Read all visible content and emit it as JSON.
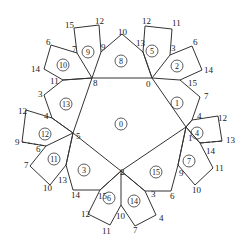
{
  "diagram": {
    "type": "planar-graph-faces",
    "faces": [
      {
        "id": "0",
        "label": "0",
        "x": 121,
        "y": 124
      },
      {
        "id": "1",
        "label": "1",
        "x": 177,
        "y": 103
      },
      {
        "id": "2",
        "label": "2",
        "x": 177,
        "y": 66
      },
      {
        "id": "3",
        "label": "3",
        "x": 84,
        "y": 170
      },
      {
        "id": "4",
        "label": "4",
        "x": 197,
        "y": 133
      },
      {
        "id": "5",
        "label": "5",
        "x": 152,
        "y": 51
      },
      {
        "id": "6",
        "label": "6",
        "x": 109,
        "y": 198
      },
      {
        "id": "7",
        "label": "7",
        "x": 189,
        "y": 161
      },
      {
        "id": "8",
        "label": "8",
        "x": 121,
        "y": 61
      },
      {
        "id": "9",
        "label": "9",
        "x": 88,
        "y": 52
      },
      {
        "id": "10",
        "label": "10",
        "x": 63,
        "y": 65
      },
      {
        "id": "11",
        "label": "11",
        "x": 54,
        "y": 159
      },
      {
        "id": "12",
        "label": "12",
        "x": 45,
        "y": 134
      },
      {
        "id": "13",
        "label": "13",
        "x": 66,
        "y": 104
      },
      {
        "id": "14",
        "label": "14",
        "x": 134,
        "y": 201
      },
      {
        "id": "15",
        "label": "15",
        "x": 156,
        "y": 172
      }
    ],
    "vertex_labels": [
      {
        "t": "0",
        "x": 146,
        "y": 87
      },
      {
        "t": "8",
        "x": 93,
        "y": 86
      },
      {
        "t": "1",
        "x": 188,
        "y": 141
      },
      {
        "t": "2",
        "x": 120,
        "y": 175
      },
      {
        "t": "5",
        "x": 76,
        "y": 139
      },
      {
        "t": "10",
        "x": 118,
        "y": 35
      },
      {
        "t": "9",
        "x": 101,
        "y": 50
      },
      {
        "t": "13",
        "x": 136,
        "y": 46
      },
      {
        "t": "15",
        "x": 65,
        "y": 28
      },
      {
        "t": "12",
        "x": 95,
        "y": 24
      },
      {
        "t": "7",
        "x": 72,
        "y": 52
      },
      {
        "t": "12",
        "x": 142,
        "y": 24
      },
      {
        "t": "11",
        "x": 172,
        "y": 26
      },
      {
        "t": "3",
        "x": 171,
        "y": 51
      },
      {
        "t": "6",
        "x": 193,
        "y": 45
      },
      {
        "t": "14",
        "x": 204,
        "y": 73
      },
      {
        "t": "15",
        "x": 188,
        "y": 86
      },
      {
        "t": "7",
        "x": 204,
        "y": 99
      },
      {
        "t": "4",
        "x": 197,
        "y": 119
      },
      {
        "t": "12",
        "x": 218,
        "y": 121
      },
      {
        "t": "13",
        "x": 226,
        "y": 143
      },
      {
        "t": "14",
        "x": 206,
        "y": 154
      },
      {
        "t": "11",
        "x": 215,
        "y": 171
      },
      {
        "t": "9",
        "x": 179,
        "y": 176
      },
      {
        "t": "10",
        "x": 192,
        "y": 193
      },
      {
        "t": "6",
        "x": 170,
        "y": 199
      },
      {
        "t": "3",
        "x": 151,
        "y": 197
      },
      {
        "t": "4",
        "x": 159,
        "y": 221
      },
      {
        "t": "7",
        "x": 133,
        "y": 233
      },
      {
        "t": "10",
        "x": 116,
        "y": 219
      },
      {
        "t": "11",
        "x": 102,
        "y": 234
      },
      {
        "t": "12",
        "x": 81,
        "y": 217
      },
      {
        "t": "15",
        "x": 98,
        "y": 199
      },
      {
        "t": "14",
        "x": 71,
        "y": 198
      },
      {
        "t": "13",
        "x": 58,
        "y": 183
      },
      {
        "t": "10",
        "x": 43,
        "y": 191
      },
      {
        "t": "7",
        "x": 24,
        "y": 168
      },
      {
        "t": "6",
        "x": 36,
        "y": 152
      },
      {
        "t": "9",
        "x": 15,
        "y": 145
      },
      {
        "t": "12",
        "x": 18,
        "y": 114
      },
      {
        "t": "4",
        "x": 44,
        "y": 119
      },
      {
        "t": "3",
        "x": 38,
        "y": 97
      },
      {
        "t": "11",
        "x": 50,
        "y": 84
      },
      {
        "t": "14",
        "x": 31,
        "y": 72
      },
      {
        "t": "6",
        "x": 46,
        "y": 45
      }
    ]
  }
}
